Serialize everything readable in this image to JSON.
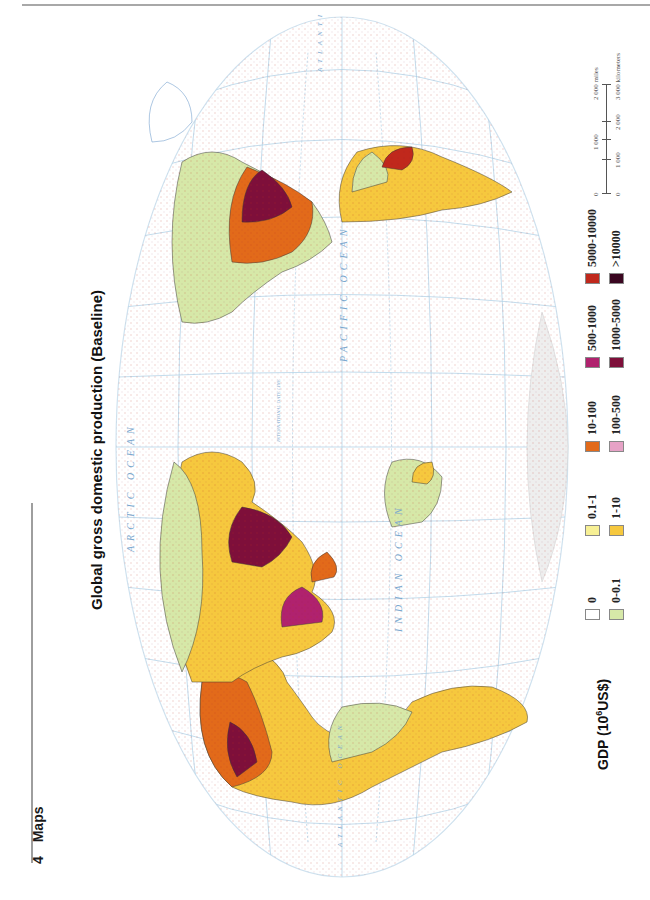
{
  "page": {
    "section_number": "4",
    "section_title": "Maps",
    "orientation": "rotated-90-ccw"
  },
  "map": {
    "title": "Global gross domestic production (Baseline)",
    "projection": "world elliptical projection with graticule",
    "ocean_labels": [
      "ARCTIC OCEAN",
      "PACIFIC OCEAN",
      "INDIAN OCEAN",
      "ATLANTIC OCEAN",
      "ATLANTIC OCEAN"
    ],
    "line_labels": [
      "INTERNATIONAL DATE LINE",
      "Equator",
      "Tropic of Cancer",
      "Tropic of Capricorn"
    ],
    "graticule_labels": [
      "0°",
      "30°",
      "60°",
      "90°",
      "120°",
      "150°",
      "180°",
      "150°",
      "120°",
      "90°",
      "60°",
      "30°"
    ],
    "colors": {
      "graticule": "#9fc6e0",
      "ocean_text": "#7aa8cf",
      "coastline": "#5a8fc4",
      "border": "#3a3a3a"
    }
  },
  "legend": {
    "title_prefix": "GDP (10",
    "title_sup": "6",
    "title_suffix": "US$)",
    "items": [
      {
        "label": "0",
        "color": "#ffffff"
      },
      {
        "label": "0.1-1",
        "color": "#f7f095"
      },
      {
        "label": "10-100",
        "color": "#e26a1a"
      },
      {
        "label": "500-1000",
        "color": "#b0226e"
      },
      {
        "label": "5000-10000",
        "color": "#c0281c"
      },
      {
        "label": "0-0.1",
        "color": "#d6e8a8"
      },
      {
        "label": "1-10",
        "color": "#f6c83e"
      },
      {
        "label": "100-500",
        "color": "#e6a2c6"
      },
      {
        "label": "1000-5000",
        "color": "#7e0f3a"
      },
      {
        "label": ">10000",
        "color": "#3a0620"
      }
    ]
  },
  "scale_bar": {
    "miles_labels": [
      "0",
      "1 000",
      "2 000 miles"
    ],
    "km_labels": [
      "0",
      "1 000",
      "2 000",
      "3 000 kilometers"
    ]
  }
}
